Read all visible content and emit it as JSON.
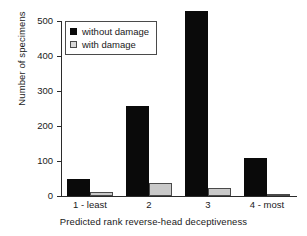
{
  "chart_data": {
    "type": "bar",
    "title": "",
    "xlabel": "Predicted rank reverse-head deceptiveness",
    "ylabel": "Number of specimens",
    "categories": [
      "1 - least",
      "2",
      "3",
      "4 - most"
    ],
    "series": [
      {
        "name": "without damage",
        "color": "#0a0a0a",
        "values": [
          49,
          257,
          528,
          108
        ]
      },
      {
        "name": "with damage",
        "color": "#c9c9c9",
        "values": [
          12,
          36,
          24,
          3
        ]
      }
    ],
    "ylim": [
      0,
      540
    ],
    "yticks": [
      0,
      100,
      200,
      300,
      400,
      500
    ],
    "ytick_labels": [
      "0",
      "100",
      "200",
      "300",
      "400",
      "500"
    ],
    "grid": false,
    "legend_position": "upper left"
  }
}
